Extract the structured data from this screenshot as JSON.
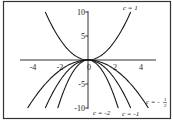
{
  "chart_data": {
    "type": "line",
    "title": "",
    "xlabel": "",
    "ylabel": "",
    "xlim": [
      -5,
      5
    ],
    "ylim": [
      -10,
      10
    ],
    "grid": false,
    "legend": "inline curve labels",
    "x_ticks": [
      "-4",
      "-2",
      "0",
      "2",
      "4"
    ],
    "y_ticks": [
      "10",
      "5",
      "-5",
      "-10"
    ],
    "function": "y = c x^2",
    "series": [
      {
        "name": "c = 1",
        "c": 1,
        "label": "c = 1",
        "x_range": [
          -3.16,
          3.16
        ]
      },
      {
        "name": "c = -1/2",
        "c": -0.5,
        "label": "c = -1/2",
        "x_range": [
          -4.47,
          4.47
        ]
      },
      {
        "name": "c = -1",
        "c": -1,
        "label": "c = -1",
        "x_range": [
          -3.16,
          3.16
        ]
      },
      {
        "name": "c = -2",
        "c": -2,
        "label": "c = -2",
        "x_range": [
          -2.24,
          2.24
        ]
      }
    ]
  },
  "labels": {
    "c1": "c = 1",
    "cm2": "c = -2",
    "cm1": "c = -1",
    "cmhalf_prefix": "c = -",
    "cmhalf_num": "1",
    "cmhalf_den": "2"
  },
  "ticks": {
    "xm4": "-4",
    "xm2": "-2",
    "x0": "0",
    "x2": "2",
    "x4": "4",
    "y10": "10",
    "y5": "5",
    "ym5": "-5",
    "ym10": "-10"
  },
  "colors": {
    "curve": "#1a1a1a",
    "frame": "#333333",
    "background": "#ffffff"
  }
}
